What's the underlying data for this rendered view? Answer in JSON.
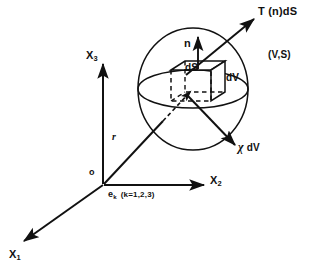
{
  "figure": {
    "background_color": "#ffffff",
    "stroke_color": "#111111",
    "width": 319,
    "height": 276
  },
  "labels": {
    "traction": "T (n)dS",
    "body_region": "(V,S)",
    "normal": "n",
    "surface_element": "dS",
    "volume_element": "dV",
    "body_force": "χ dV",
    "body_force_symbol": "χ",
    "body_force_suffix": "dV",
    "axis_x3": "X",
    "axis_x3_sub": "3",
    "axis_x2": "X",
    "axis_x2_sub": "2",
    "axis_x1": "X",
    "axis_x1_sub": "1",
    "position_vector": "r",
    "origin": "o",
    "basis_vector": "e",
    "basis_vector_sub": "k",
    "basis_vector_range": "(k=1,2,3)"
  },
  "geometry": {
    "sphere": {
      "cx": 193,
      "cy": 89,
      "rx": 55,
      "ry": 61,
      "equator_ry": 19
    },
    "cube": {
      "front_left_x": 171,
      "front_right_x": 211,
      "top_y": 70,
      "bottom_y": 101,
      "depth_dx": 14,
      "depth_dy": -9
    },
    "origin": {
      "x": 103,
      "y": 185
    },
    "axes": {
      "x3_tip": {
        "x": 103,
        "y": 62
      },
      "x2_tip": {
        "x": 206,
        "y": 185
      },
      "x1_tip": {
        "x": 22,
        "y": 243
      }
    },
    "traction_arrow": {
      "from_x": 185,
      "from_y": 74,
      "to_x": 256,
      "to_y": 17
    },
    "body_force_arrow": {
      "from_x": 188,
      "from_y": 97,
      "to_x": 237,
      "to_y": 147
    },
    "position_arrow": {
      "from_x": 103,
      "from_y": 185,
      "to_x": 190,
      "to_y": 92
    }
  },
  "icons": {
    "sphere": "sphere-outline-icon",
    "cube": "cube-wireframe-icon",
    "normal_arrow": "up-arrow-icon",
    "traction_arrow": "diagonal-arrow-icon",
    "body_force_arrow": "diagonal-arrow-icon",
    "position_arrow": "vector-arrow-icon"
  }
}
